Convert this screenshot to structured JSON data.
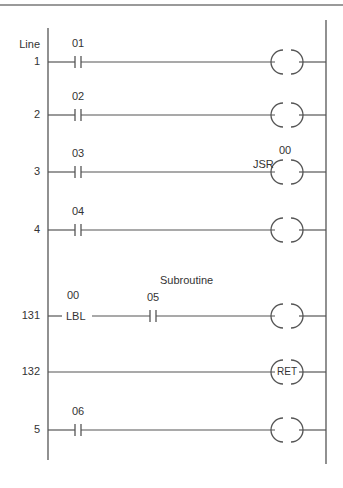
{
  "header": {
    "fragment": ""
  },
  "diagram": {
    "type": "ladder-logic",
    "line_heading": "Line",
    "section_label": "Subroutine",
    "rails": {
      "left_x": 48,
      "right_x": 326,
      "top_y": 28,
      "bottom_y": 460
    },
    "rungs": [
      {
        "line": "1",
        "y": 62,
        "contact": "01",
        "contact_x": 75,
        "prefix_label": "",
        "prefix_addr": "",
        "coil_label": "",
        "coil_addr": "",
        "coil_text": ""
      },
      {
        "line": "2",
        "y": 115,
        "contact": "02",
        "contact_x": 75,
        "prefix_label": "",
        "prefix_addr": "",
        "coil_label": "",
        "coil_addr": "",
        "coil_text": ""
      },
      {
        "line": "3",
        "y": 172,
        "contact": "03",
        "contact_x": 75,
        "prefix_label": "",
        "prefix_addr": "",
        "coil_label": "JSR",
        "coil_addr": "00",
        "coil_text": ""
      },
      {
        "line": "4",
        "y": 230,
        "contact": "04",
        "contact_x": 75,
        "prefix_label": "",
        "prefix_addr": "",
        "coil_label": "",
        "coil_addr": "",
        "coil_text": ""
      },
      {
        "line": "131",
        "y": 316,
        "contact": "05",
        "contact_x": 150,
        "prefix_label": "LBL",
        "prefix_addr": "00",
        "coil_label": "",
        "coil_addr": "",
        "coil_text": ""
      },
      {
        "line": "132",
        "y": 372,
        "contact": "",
        "contact_x": 0,
        "prefix_label": "",
        "prefix_addr": "",
        "coil_label": "",
        "coil_addr": "",
        "coil_text": "RET"
      },
      {
        "line": "5",
        "y": 430,
        "contact": "06",
        "contact_x": 75,
        "prefix_label": "",
        "prefix_addr": "",
        "coil_label": "",
        "coil_addr": "",
        "coil_text": ""
      }
    ],
    "colors": {
      "line": "#555555",
      "text": "#333333",
      "rule": "#9a9a9a"
    }
  }
}
